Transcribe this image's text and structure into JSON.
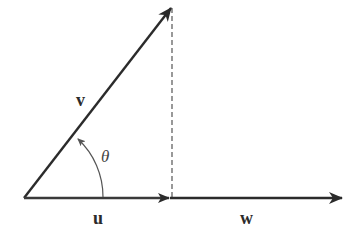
{
  "diagram": {
    "colors": {
      "stroke": "#2b2b2b",
      "dashed": "#555555",
      "background": "#ffffff"
    },
    "vectors": [
      {
        "id": "v",
        "label": "v",
        "from": [
          24,
          198
        ],
        "to": [
          172,
          7
        ]
      },
      {
        "id": "u",
        "label": "u",
        "from": [
          24,
          198
        ],
        "to": [
          170,
          198
        ]
      },
      {
        "id": "w",
        "label": "w",
        "from": [
          170,
          198
        ],
        "to": [
          343,
          198
        ]
      }
    ],
    "angle": {
      "label": "θ",
      "vertex": [
        24,
        198
      ]
    },
    "projection_line": {
      "style": "dashed",
      "from": [
        172,
        7
      ],
      "to": [
        172,
        198
      ]
    },
    "labels": {
      "v": "v",
      "u": "u",
      "w": "w",
      "theta": "θ"
    }
  }
}
